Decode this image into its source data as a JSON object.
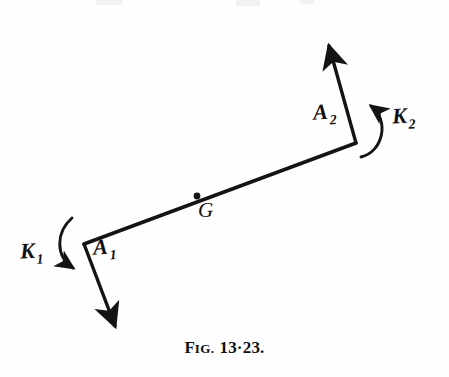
{
  "figure": {
    "caption_prefix": "F",
    "caption_smallcaps": "IG.",
    "caption_number": "13·23.",
    "caption_full": "FIG. 13·23.",
    "background_color": "#fefefe",
    "ink_color": "#111111"
  },
  "labels": {
    "a1": {
      "base": "A",
      "sub": "1"
    },
    "a2": {
      "base": "A",
      "sub": "2"
    },
    "k1": {
      "base": "K",
      "sub": "1"
    },
    "k2": {
      "base": "K",
      "sub": "2"
    },
    "g": {
      "base": "G"
    }
  },
  "diagram": {
    "type": "mechanics-free-body-diagram",
    "points": {
      "a1_vertex": {
        "x": 84,
        "y": 244
      },
      "a2_vertex": {
        "x": 356,
        "y": 143
      },
      "g_point": {
        "x": 197,
        "y": 196
      },
      "a1_arrow_tip": {
        "x": 118,
        "y": 334
      },
      "a2_arrow_tip": {
        "x": 327,
        "y": 37
      }
    },
    "rod": {
      "from": {
        "x": 84,
        "y": 244
      },
      "to": {
        "x": 356,
        "y": 143
      }
    },
    "force_arrows": [
      {
        "name": "A1",
        "from": {
          "x": 84,
          "y": 244
        },
        "to": {
          "x": 118,
          "y": 334
        }
      },
      {
        "name": "A2",
        "from": {
          "x": 356,
          "y": 143
        },
        "to": {
          "x": 327,
          "y": 37
        }
      }
    ],
    "couple_arcs": [
      {
        "name": "K1",
        "direction": "clockwise",
        "start": {
          "x": 73,
          "y": 219
        },
        "end": {
          "x": 83,
          "y": 273
        }
      },
      {
        "name": "K2",
        "direction": "counterclockwise",
        "start": {
          "x": 362,
          "y": 156
        },
        "end": {
          "x": 368,
          "y": 100
        }
      }
    ]
  }
}
